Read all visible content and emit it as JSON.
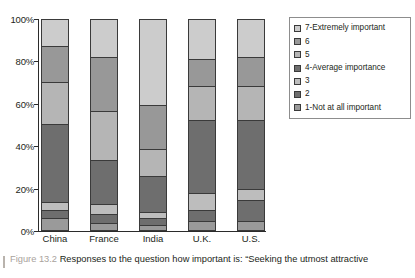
{
  "chart_data": {
    "type": "bar",
    "subtype": "stacked-percent-column",
    "title": "",
    "xlabel": "",
    "ylabel": "",
    "ylim": [
      0,
      100
    ],
    "ytick_labels": [
      "0%",
      "20%",
      "40%",
      "60%",
      "80%",
      "100%"
    ],
    "ytick_values": [
      0,
      20,
      40,
      60,
      80,
      100
    ],
    "grid": false,
    "legend_position": "right",
    "categories": [
      "China",
      "France",
      "India",
      "U.K.",
      "U.S."
    ],
    "series": [
      {
        "name": "1-Not at all important",
        "color": "#9a9a9a",
        "values": [
          5,
          3,
          2,
          4,
          4
        ]
      },
      {
        "name": "2",
        "color": "#6e6e6e",
        "values": [
          4,
          4,
          3,
          5,
          10
        ]
      },
      {
        "name": "3",
        "color": "#bdbdbd",
        "values": [
          4,
          5,
          3,
          8,
          5
        ]
      },
      {
        "name": "4-Average importance",
        "color": "#6e6e6e",
        "values": [
          37,
          21,
          17,
          35,
          33
        ]
      },
      {
        "name": "5",
        "color": "#b5b5b5",
        "values": [
          20,
          23,
          13,
          16,
          16
        ]
      },
      {
        "name": "6",
        "color": "#989898",
        "values": [
          17,
          26,
          21,
          13,
          14
        ]
      },
      {
        "name": "7-Extremely important",
        "color": "#cccccc",
        "values": [
          13,
          18,
          41,
          19,
          18
        ]
      }
    ]
  },
  "axis": {
    "y_ticks": [
      "100%",
      "80%",
      "60%",
      "40%",
      "20%",
      "0%"
    ],
    "categories": [
      "China",
      "France",
      "India",
      "U.K.",
      "U.S."
    ]
  },
  "legend": {
    "items": [
      {
        "label": "7-Extremely important",
        "color": "#cccccc"
      },
      {
        "label": "6",
        "color": "#989898"
      },
      {
        "label": "5",
        "color": "#b5b5b5"
      },
      {
        "label": "4-Average importance",
        "color": "#6e6e6e"
      },
      {
        "label": "3",
        "color": "#bdbdbd"
      },
      {
        "label": "2",
        "color": "#6e6e6e"
      },
      {
        "label": "1-Not at all important",
        "color": "#9a9a9a"
      }
    ]
  },
  "caption": {
    "figure_number": "Figure 13.2",
    "text": "Responses to the question how important is: “Seeking the utmost attractive"
  }
}
